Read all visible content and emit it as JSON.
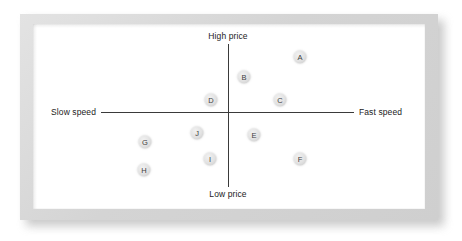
{
  "figure": {
    "kind": "perceptual-map",
    "frame_color": "#d6d6d6",
    "board_color": "#ffffff",
    "axis_color": "#3a3a3a",
    "bubble_fill": "#e2e2e2",
    "bubble_text_color": "#3d3d3d"
  },
  "chart_data": {
    "type": "scatter",
    "title": "",
    "subtitle": "",
    "xlabel": "",
    "ylabel": "",
    "xlim": [
      -100,
      100
    ],
    "ylim": [
      -100,
      100
    ],
    "grid": false,
    "legend": null,
    "axis_labels": {
      "top": "High price",
      "bottom": "Low price",
      "left": "Slow speed",
      "right": "Fast speed"
    },
    "axes": {
      "x_axis_label_left": "Slow speed",
      "x_axis_label_right": "Fast speed",
      "y_axis_label_top": "High price",
      "y_axis_label_bottom": "Low price"
    },
    "points": [
      {
        "label": "A",
        "x": 57,
        "y": 77,
        "px": 300,
        "py": 57
      },
      {
        "label": "B",
        "x": 13,
        "y": 49,
        "px": 244,
        "py": 77
      },
      {
        "label": "C",
        "x": 41,
        "y": 17,
        "px": 280,
        "py": 100
      },
      {
        "label": "D",
        "x": -13,
        "y": 17,
        "px": 211,
        "py": 100
      },
      {
        "label": "E",
        "x": 21,
        "y": -32,
        "px": 254,
        "py": 135
      },
      {
        "label": "F",
        "x": 57,
        "y": -66,
        "px": 300,
        "py": 159
      },
      {
        "label": "G",
        "x": -66,
        "y": -42,
        "px": 145,
        "py": 142
      },
      {
        "label": "H",
        "x": -67,
        "y": -81,
        "px": 144,
        "py": 170
      },
      {
        "label": "I",
        "x": -14,
        "y": -66,
        "px": 210,
        "py": 159
      },
      {
        "label": "J",
        "x": -25,
        "y": -29,
        "px": 197,
        "py": 133
      }
    ]
  }
}
